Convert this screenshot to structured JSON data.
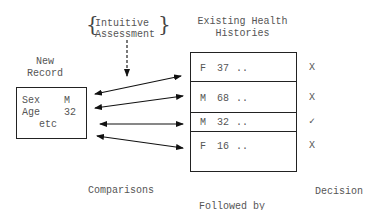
{
  "assessment": {
    "brace_left": "{",
    "line1": "Intuitive",
    "line2": "Assessment",
    "brace_right": "}"
  },
  "new_record": {
    "title_line1": "New",
    "title_line2": "Record",
    "fields": [
      {
        "label": "Sex",
        "value": "M"
      },
      {
        "label": "Age",
        "value": "32"
      }
    ],
    "more": "etc"
  },
  "histories": {
    "title_line1": "Existing Health",
    "title_line2": "Histories",
    "rows": [
      {
        "sex": "F",
        "age": "37",
        "more": "..",
        "decision": "X"
      },
      {
        "sex": "M",
        "age": "68",
        "more": "..",
        "decision": "X"
      },
      {
        "sex": "M",
        "age": "32",
        "more": "..",
        "decision": "✓"
      },
      {
        "sex": "F",
        "age": "16",
        "more": "..",
        "decision": "X"
      }
    ]
  },
  "labels": {
    "comparisons": "Comparisons",
    "followed_by": "Followed by",
    "decision": "Decision"
  }
}
